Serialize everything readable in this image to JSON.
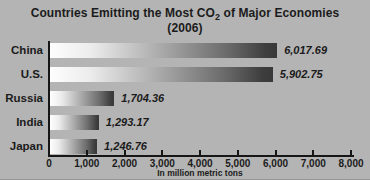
{
  "figure": {
    "background": "#b4b4b4",
    "title": {
      "part1": "Countries Emitting the Most CO",
      "sub": "2",
      "part2": " of Major Economies",
      "line2": "(2006)"
    }
  },
  "chart_data": {
    "type": "bar",
    "orientation": "horizontal",
    "title": "Countries Emitting the Most CO2 of Major Economies (2006)",
    "categories": [
      "China",
      "U.S.",
      "Russia",
      "India",
      "Japan"
    ],
    "values": [
      6017.69,
      5902.75,
      1704.36,
      1293.17,
      1246.76
    ],
    "value_labels": [
      "6,017.69",
      "5,902.75",
      "1,704.36",
      "1,293.17",
      "1,246.76"
    ],
    "xlabel": "In million metric tons",
    "xlim": [
      0,
      8000
    ],
    "xticks": [
      0,
      1000,
      2000,
      3000,
      4000,
      5000,
      6000,
      7000,
      8000
    ],
    "xtick_labels": [
      "0",
      "1,000",
      "2,000",
      "3,000",
      "4,000",
      "5,000",
      "6,000",
      "7,000",
      "8,000"
    ],
    "grid": false,
    "legend": "none",
    "bar_gradient": [
      "#fefefe",
      "#393939"
    ],
    "axis_color": "#161616",
    "text_color": "#1b1b1b"
  }
}
